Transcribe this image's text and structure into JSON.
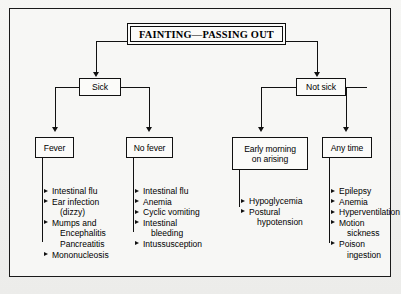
{
  "chart": {
    "type": "flowchart",
    "title": "FAINTING—PASSING OUT",
    "root": "FAINTING—PASSING OUT",
    "level1": [
      {
        "id": "sick",
        "label": "Sick"
      },
      {
        "id": "not-sick",
        "label": "Not sick"
      }
    ],
    "level2": [
      {
        "id": "fever",
        "label": "Fever",
        "parent": "sick"
      },
      {
        "id": "no-fever",
        "label": "No fever",
        "parent": "sick"
      },
      {
        "id": "early-morning",
        "label": "Early morning\non arising",
        "line1": "Early morning",
        "line2": "on arising",
        "parent": "not-sick"
      },
      {
        "id": "any-time",
        "label": "Any time",
        "parent": "not-sick"
      }
    ],
    "lists": [
      {
        "id": "fever-list",
        "parent": "fever",
        "items": [
          {
            "text": "Intestinal flu",
            "arrow": true,
            "indent": false
          },
          {
            "text": "Ear infection",
            "arrow": true,
            "indent": false
          },
          {
            "text": "(dizzy)",
            "arrow": false,
            "indent": true
          },
          {
            "text": "Mumps and",
            "arrow": true,
            "indent": false
          },
          {
            "text": "Encephalitis",
            "arrow": false,
            "indent": true
          },
          {
            "text": "Pancreatitis",
            "arrow": false,
            "indent": true
          },
          {
            "text": "Mononucleosis",
            "arrow": true,
            "indent": false
          }
        ]
      },
      {
        "id": "no-fever-list",
        "parent": "no-fever",
        "items": [
          {
            "text": "Intestinal flu",
            "arrow": true,
            "indent": false
          },
          {
            "text": "Anemia",
            "arrow": true,
            "indent": false
          },
          {
            "text": "Cyclic vomiting",
            "arrow": true,
            "indent": false
          },
          {
            "text": "Intestinal",
            "arrow": true,
            "indent": false
          },
          {
            "text": "bleeding",
            "arrow": false,
            "indent": true
          },
          {
            "text": "Intussusception",
            "arrow": true,
            "indent": false
          }
        ]
      },
      {
        "id": "early-morning-list",
        "parent": "early-morning",
        "items": [
          {
            "text": "Hypoglycemia",
            "arrow": true,
            "indent": false
          },
          {
            "text": "Postural",
            "arrow": true,
            "indent": false
          },
          {
            "text": "hypotension",
            "arrow": false,
            "indent": true
          }
        ]
      },
      {
        "id": "any-time-list",
        "parent": "any-time",
        "items": [
          {
            "text": "Epilepsy",
            "arrow": true,
            "indent": false
          },
          {
            "text": "Anemia",
            "arrow": true,
            "indent": false
          },
          {
            "text": "Hyperventilation",
            "arrow": true,
            "indent": false
          },
          {
            "text": "Motion",
            "arrow": true,
            "indent": false
          },
          {
            "text": "sickness",
            "arrow": false,
            "indent": true
          },
          {
            "text": "Poison",
            "arrow": true,
            "indent": false
          },
          {
            "text": "ingestion",
            "arrow": false,
            "indent": true
          }
        ]
      }
    ],
    "colors": {
      "ink": "#111111",
      "paper": "#f7f7f5",
      "background": "#f1f1ef"
    }
  }
}
